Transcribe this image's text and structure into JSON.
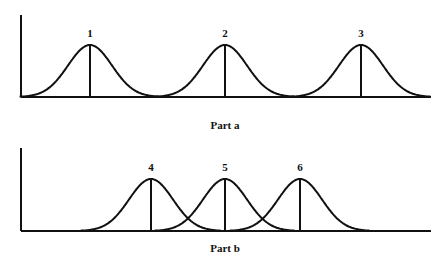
{
  "panels": [
    {
      "caption": "Part a",
      "peaks": [
        {
          "label": "1",
          "x": 90
        },
        {
          "label": "2",
          "x": 225
        },
        {
          "label": "3",
          "x": 361
        }
      ],
      "axis": {
        "x": 21,
        "top": 15,
        "baseline": 97,
        "right": 431
      },
      "peak_top": 45,
      "label_y": 37,
      "caption_y": 129,
      "sigma": 22
    },
    {
      "caption": "Part b",
      "peaks": [
        {
          "label": "4",
          "x": 151
        },
        {
          "label": "5",
          "x": 225
        },
        {
          "label": "6",
          "x": 300
        }
      ],
      "axis": {
        "x": 21,
        "top": 148,
        "baseline": 231,
        "right": 431
      },
      "peak_top": 179,
      "label_y": 171,
      "caption_y": 252,
      "sigma": 22
    }
  ],
  "colors": {
    "line": "#111111",
    "background": "#ffffff"
  }
}
